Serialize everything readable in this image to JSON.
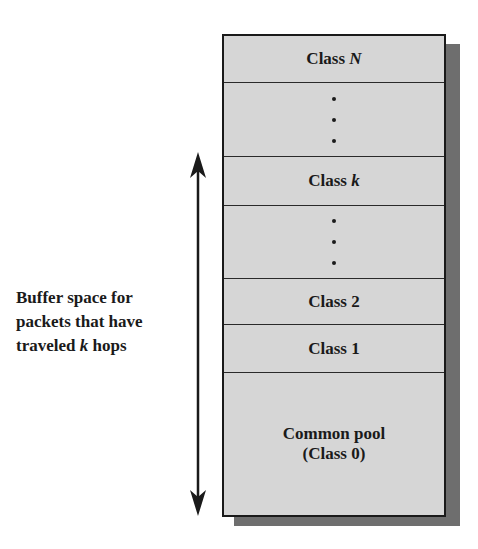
{
  "diagram": {
    "type": "buffer-class-stack",
    "cells": [
      {
        "id": "class-n",
        "prefix": "Class ",
        "var": "N",
        "kind": "label"
      },
      {
        "id": "ellipsis-1",
        "kind": "dots"
      },
      {
        "id": "class-k",
        "prefix": "Class ",
        "var": "k",
        "kind": "label"
      },
      {
        "id": "ellipsis-2",
        "kind": "dots"
      },
      {
        "id": "class-2",
        "text": "Class 2",
        "kind": "label"
      },
      {
        "id": "class-1",
        "text": "Class 1",
        "kind": "label"
      },
      {
        "id": "common-pool",
        "line1": "Common pool",
        "line2": "(Class 0)",
        "kind": "label"
      }
    ],
    "annotation": {
      "line1": "Buffer space for",
      "line2": "packets that have",
      "line3_prefix": "traveled ",
      "line3_var": "k",
      "line3_suffix": " hops"
    },
    "arrow": {
      "direction": "bidirectional-vertical",
      "spans": "Class k through Common pool"
    },
    "colors": {
      "cell_fill": "#d6d6d6",
      "border": "#1a1a1a",
      "shadow": "#6e6e6e"
    }
  }
}
